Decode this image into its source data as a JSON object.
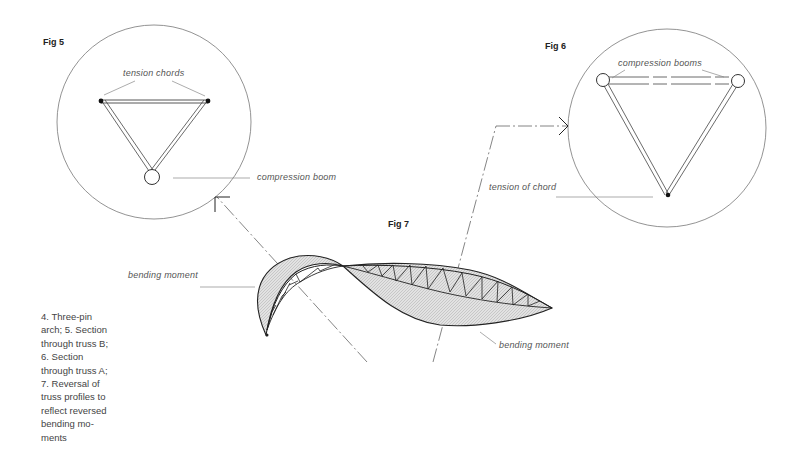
{
  "figures": {
    "fig5": {
      "label": "Fig 5",
      "annotations": {
        "tension_chords": "tension chords",
        "compression_boom": "compression boom"
      }
    },
    "fig6": {
      "label": "Fig 6",
      "annotations": {
        "compression_booms": "compression booms",
        "tension_of_chord": "tension of chord"
      }
    },
    "fig7": {
      "label": "Fig 7",
      "annotations": {
        "bending_moment_left": "bending moment",
        "bending_moment_right": "bending moment"
      }
    }
  },
  "caption": {
    "lines": [
      "4. Three-pin",
      "arch; 5. Section",
      "through truss B;",
      "6. Section",
      "through truss A;",
      "7. Reversal of",
      "truss profiles to",
      "reflect reversed",
      "bending mo-",
      "ments"
    ]
  },
  "colors": {
    "line": "#333333",
    "thin_line": "#777777",
    "hatch_fill": "#d8d8d8",
    "text": "#555555"
  }
}
